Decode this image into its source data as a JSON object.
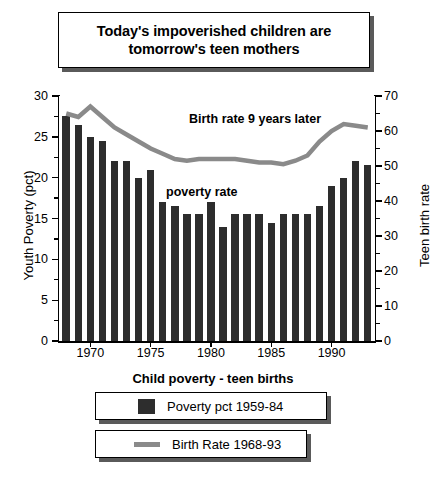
{
  "title": {
    "line1": "Today's impoverished children are",
    "line2": "tomorrow's teen mothers"
  },
  "annotations": {
    "birth_line": "Birth rate 9 years later",
    "poverty_bars": "poverty rate"
  },
  "footer": {
    "caption": "Child poverty - teen births",
    "legend": [
      {
        "label": "Poverty pct 1959-84",
        "marker": "bar-swatch",
        "color": "#2d2d2d"
      },
      {
        "label": "Birth Rate 1968-93",
        "marker": "line-swatch",
        "color": "#8a8a8a"
      }
    ]
  },
  "chart_data": {
    "type": "bar",
    "subtitle": "Child poverty - teen births",
    "xlabel": "",
    "ylabel": "Youth Poverty (pct)",
    "y2label": "Teen birth rate",
    "ylim": [
      0,
      30
    ],
    "y2lim": [
      0,
      70
    ],
    "yticks": [
      0,
      5,
      10,
      15,
      20,
      25,
      30
    ],
    "y2ticks": [
      0,
      10,
      20,
      30,
      40,
      50,
      60,
      70
    ],
    "xticks": [
      1970,
      1975,
      1980,
      1985,
      1990
    ],
    "xlim": [
      1967.4,
      1993.6
    ],
    "grid": false,
    "legend_position": "bottom",
    "categories": [
      1968,
      1969,
      1970,
      1971,
      1972,
      1973,
      1974,
      1975,
      1976,
      1977,
      1978,
      1979,
      1980,
      1981,
      1982,
      1983,
      1984,
      1985,
      1986,
      1987,
      1988,
      1989,
      1990,
      1991,
      1992,
      1993
    ],
    "series": [
      {
        "name": "Poverty pct 1959-84",
        "type": "bar",
        "axis": "left",
        "color": "#2d2d2d",
        "values": [
          27.5,
          26.5,
          25.0,
          24.5,
          22.0,
          22.0,
          20.0,
          21.0,
          17.0,
          16.5,
          15.5,
          15.5,
          17.0,
          14.0,
          15.5,
          15.5,
          15.5,
          14.5,
          15.5,
          15.5,
          15.5,
          16.5,
          19.0,
          20.0,
          22.0,
          21.5
        ]
      },
      {
        "name": "Birth Rate 1968-93",
        "type": "line",
        "axis": "right",
        "color": "#8a8a8a",
        "values": [
          65.0,
          64.0,
          67.0,
          64.0,
          61.0,
          59.0,
          57.0,
          55.0,
          53.5,
          52.0,
          51.5,
          52.0,
          52.0,
          52.0,
          52.0,
          51.5,
          51.0,
          51.0,
          50.5,
          51.5,
          53.0,
          57.0,
          60.0,
          62.0,
          61.5,
          61.0
        ]
      }
    ]
  }
}
